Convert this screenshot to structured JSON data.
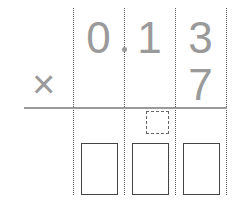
{
  "problem": {
    "operator": "×",
    "multiplicand_digits": [
      "0",
      "1",
      "3"
    ],
    "decimal_point_after_index": 0,
    "multiplier_digit": "7",
    "answer_boxes": [
      "",
      "",
      ""
    ],
    "carry_box": ""
  },
  "colors": {
    "digit": "#9a9a9a",
    "grid_line": "#555555",
    "box_border": "#444444"
  }
}
